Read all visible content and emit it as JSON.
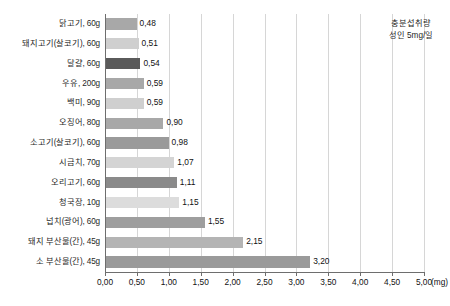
{
  "chart_data": {
    "type": "bar",
    "orientation": "horizontal",
    "title": "",
    "subtitle": "",
    "xlabel": "(mg)",
    "ylabel": "",
    "xlim": [
      0,
      5
    ],
    "xtick_step": 0.5,
    "grid": true,
    "legend": "none",
    "categories": [
      "닭고기, 60g",
      "돼지고기(살코기), 60g",
      "달걀, 60g",
      "우유, 200g",
      "백미, 90g",
      "오징어, 80g",
      "소고기(살코기), 60g",
      "시금치, 70g",
      "오리고기, 60g",
      "청국장, 10g",
      "넙치(광어), 60g",
      "돼지 부산물(간), 45g",
      "소 부산물(간), 45g"
    ],
    "values": [
      0.48,
      0.51,
      0.54,
      0.59,
      0.59,
      0.9,
      0.98,
      1.07,
      1.11,
      1.15,
      1.55,
      2.15,
      3.2
    ],
    "value_labels": [
      "0,48",
      "0,51",
      "0,54",
      "0,59",
      "0,59",
      "0,90",
      "0,98",
      "1,07",
      "1,11",
      "1,15",
      "1,55",
      "2,15",
      "3,20"
    ],
    "bar_colors": [
      "#a8a8a8",
      "#cfcfcf",
      "#5a5a5a",
      "#a8a8a8",
      "#cfcfcf",
      "#a8a8a8",
      "#9a9a9a",
      "#d4d4d4",
      "#8a8a8a",
      "#dcdcdc",
      "#9e9e9e",
      "#b4b4b4",
      "#9a9a9a"
    ],
    "xticklabels": [
      "0,00",
      "0,50",
      "1,00",
      "1,50",
      "2,00",
      "2,50",
      "3,00",
      "3,50",
      "4,00",
      "4,50",
      "5,00"
    ],
    "xtick_values": [
      0,
      0.5,
      1,
      1.5,
      2,
      2.5,
      3,
      3.5,
      4,
      4.5,
      5
    ],
    "annotations": [
      {
        "line1": "충분섭취량",
        "line2": "성인 5mg/일",
        "x": 5.0
      }
    ]
  },
  "axis": {
    "unit_label": "(mg)"
  },
  "annotation": {
    "line1": "충분섭취량",
    "line2": "성인 5mg/일"
  },
  "colors": {
    "axis": "#6e6e6e",
    "grid": "#d6d6d6",
    "text": "#1f1f1f",
    "background": "#ffffff"
  }
}
